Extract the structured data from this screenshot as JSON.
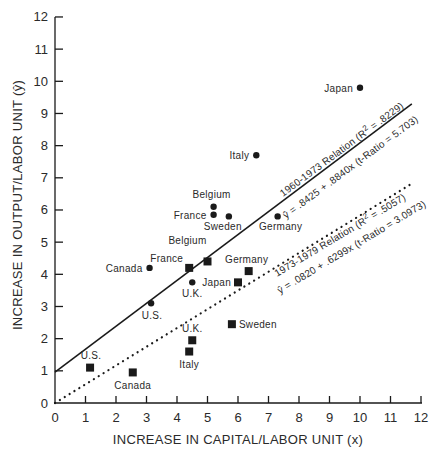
{
  "chart_data": {
    "type": "scatter",
    "title": "",
    "xlabel": "INCREASE IN CAPITAL/LABOR UNIT (x)",
    "ylabel": "INCREASE IN OUTPUT/LABOR UNIT (ŷ)",
    "xlim": [
      0,
      12
    ],
    "ylim": [
      0,
      12
    ],
    "x_ticks": [
      "0",
      "1",
      "2",
      "3",
      "4",
      "5",
      "6",
      "7",
      "8",
      "9",
      "10",
      "11",
      "12"
    ],
    "y_ticks": [
      "0",
      "1",
      "2",
      "3",
      "4",
      "5",
      "6",
      "7",
      "8",
      "9",
      "10",
      "11",
      "12"
    ],
    "grid": false,
    "legend": null,
    "series": [
      {
        "name": "1960-1973",
        "marker": "circle",
        "points": [
          {
            "label": "Japan",
            "x": 10.0,
            "y": 9.8
          },
          {
            "label": "Italy",
            "x": 6.6,
            "y": 7.7
          },
          {
            "label": "Belgium",
            "x": 5.2,
            "y": 6.1
          },
          {
            "label": "France",
            "x": 5.2,
            "y": 5.85
          },
          {
            "label": "Sweden",
            "x": 5.7,
            "y": 5.8
          },
          {
            "label": "Germany",
            "x": 7.3,
            "y": 5.8
          },
          {
            "label": "Canada",
            "x": 3.1,
            "y": 4.2
          },
          {
            "label": "U.K.",
            "x": 4.5,
            "y": 3.75
          },
          {
            "label": "U.S.",
            "x": 3.15,
            "y": 3.1
          }
        ],
        "fit": {
          "style": "solid",
          "label": "1960-1973 Relation (R² = .8229)",
          "equation": "ŷ = .8425 + .8840x (t-Ratio = 5.703)",
          "intercept": 0.8425,
          "slope": 0.884,
          "r2": 0.8229,
          "t_ratio": 5.703,
          "drawn_from": [
            0,
            0.96
          ],
          "drawn_to": [
            11.7,
            9.3
          ]
        }
      },
      {
        "name": "1973-1979",
        "marker": "square",
        "points": [
          {
            "label": "Belgium",
            "x": 5.0,
            "y": 4.4
          },
          {
            "label": "France",
            "x": 4.4,
            "y": 4.2
          },
          {
            "label": "Germany",
            "x": 6.35,
            "y": 4.1
          },
          {
            "label": "Japan",
            "x": 6.0,
            "y": 3.75
          },
          {
            "label": "Sweden",
            "x": 5.8,
            "y": 2.45
          },
          {
            "label": "U.K.",
            "x": 4.5,
            "y": 1.95
          },
          {
            "label": "Italy",
            "x": 4.4,
            "y": 1.6
          },
          {
            "label": "U.S.",
            "x": 1.15,
            "y": 1.1
          },
          {
            "label": "Canada",
            "x": 2.55,
            "y": 0.95
          }
        ],
        "fit": {
          "style": "dotted",
          "label": "1973-1979 Relation (R² = .5057)",
          "equation": "ŷ = .0820 + .6299x (t-Ratio = 3.0973)",
          "intercept": 0.082,
          "slope": 0.6299,
          "r2": 0.5057,
          "t_ratio": 3.0973,
          "drawn_from": [
            0,
            0.0
          ],
          "drawn_to": [
            11.75,
            6.85
          ]
        }
      }
    ]
  },
  "annotations": {
    "rel1_title_prefix": "1960-1973 Relation (R",
    "rel1_title_sup": "2",
    "rel1_title_suffix": " = .8229)",
    "rel1_equation": "ŷ = .8425 + .8840x (t-Ratio = 5.703)",
    "rel2_title_prefix": "1973-1979 Relation (R",
    "rel2_title_sup": "2",
    "rel2_title_suffix": " = .5057)",
    "rel2_equation": "ŷ = .0820 + .6299x (t-Ratio = 3.0973)"
  },
  "colors": {
    "ink": "#1a1a1a",
    "text": "#2a2a2a",
    "background": "#ffffff"
  }
}
